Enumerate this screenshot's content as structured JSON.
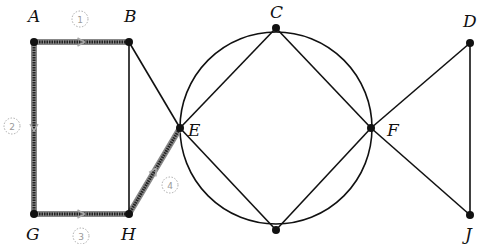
{
  "diagram": {
    "type": "graph",
    "nodes": [
      {
        "id": "A",
        "label": "A",
        "x": 34,
        "y": 42,
        "lx": 28,
        "ly": 22
      },
      {
        "id": "B",
        "label": "B",
        "x": 129,
        "y": 42,
        "lx": 124,
        "ly": 22
      },
      {
        "id": "C",
        "label": "C",
        "x": 276,
        "y": 28,
        "lx": 270,
        "ly": 18
      },
      {
        "id": "D",
        "label": "D",
        "x": 470,
        "y": 43,
        "lx": 463,
        "ly": 27
      },
      {
        "id": "E",
        "label": "E",
        "x": 180,
        "y": 128,
        "lx": 188,
        "ly": 136
      },
      {
        "id": "F",
        "label": "F",
        "x": 371,
        "y": 128,
        "lx": 387,
        "ly": 136
      },
      {
        "id": "G",
        "label": "G",
        "x": 34,
        "y": 214,
        "lx": 26,
        "ly": 240
      },
      {
        "id": "H",
        "label": "H",
        "x": 129,
        "y": 214,
        "lx": 121,
        "ly": 240
      },
      {
        "id": "I",
        "label": "",
        "x": 276,
        "y": 230,
        "lx": 276,
        "ly": 248
      },
      {
        "id": "J",
        "label": "J",
        "x": 470,
        "y": 215,
        "lx": 465,
        "ly": 240
      }
    ],
    "edges": [
      {
        "from": "A",
        "to": "B",
        "highlighted": true
      },
      {
        "from": "A",
        "to": "G",
        "highlighted": true
      },
      {
        "from": "G",
        "to": "H",
        "highlighted": true
      },
      {
        "from": "H",
        "to": "E",
        "highlighted": true
      },
      {
        "from": "B",
        "to": "H",
        "highlighted": false
      },
      {
        "from": "B",
        "to": "E",
        "highlighted": false
      },
      {
        "from": "E",
        "to": "C",
        "highlighted": false
      },
      {
        "from": "E",
        "to": "I",
        "highlighted": false
      },
      {
        "from": "C",
        "to": "F",
        "highlighted": false
      },
      {
        "from": "I",
        "to": "F",
        "highlighted": false
      },
      {
        "from": "F",
        "to": "D",
        "highlighted": false
      },
      {
        "from": "F",
        "to": "J",
        "highlighted": false
      },
      {
        "from": "D",
        "to": "J",
        "highlighted": false
      }
    ],
    "circle": {
      "cx": 276,
      "cy": 128,
      "r": 96
    },
    "path_steps": [
      {
        "num": "1",
        "x": 80,
        "y": 19
      },
      {
        "num": "2",
        "x": 12,
        "y": 126
      },
      {
        "num": "3",
        "x": 81,
        "y": 236
      },
      {
        "num": "4",
        "x": 170,
        "y": 185
      }
    ],
    "colors": {
      "line": "#111111",
      "highlight": "#555555",
      "node": "#111111",
      "step": "#999999"
    }
  }
}
